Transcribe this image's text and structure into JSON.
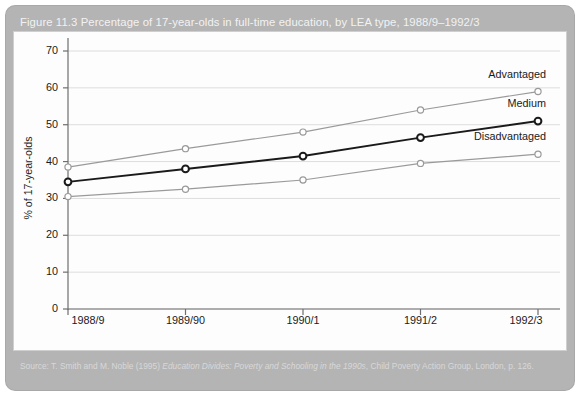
{
  "figure": {
    "caption": "Figure 11.3   Percentage of 17-year-olds in full-time education, by LEA type, 1988/9–1992/3",
    "source_prefix": "Source: T. Smith and M. Noble (1995) ",
    "source_italic": "Education Divides: Poverty and Schooling in the 1990s",
    "source_suffix": ", Child Poverty Action Group, London, p. 126."
  },
  "chart_data": {
    "type": "line",
    "title": "Percentage of 17-year-olds in full-time education, by LEA type, 1988/9–1992/3",
    "xlabel": "",
    "ylabel": "% of 17-year-olds",
    "categories": [
      "1988/9",
      "1989/90",
      "1990/1",
      "1991/2",
      "1992/3"
    ],
    "ylim": [
      0,
      70
    ],
    "yticks": [
      0,
      10,
      20,
      30,
      40,
      50,
      60,
      70
    ],
    "grid": true,
    "legend_position": "right-inline",
    "series": [
      {
        "name": "Advantaged",
        "color": "#9a9a9a",
        "values": [
          38.5,
          43.5,
          48.0,
          54.0,
          59.0
        ]
      },
      {
        "name": "Medium",
        "color": "#1a1a1a",
        "values": [
          34.5,
          38.0,
          41.5,
          46.5,
          51.0
        ]
      },
      {
        "name": "Disadvantaged",
        "color": "#9a9a9a",
        "values": [
          30.5,
          32.5,
          35.0,
          39.5,
          42.0
        ]
      }
    ]
  },
  "colors": {
    "panel": "#b4b4b4",
    "plot_background": "#fdfdfd",
    "axis": "#6e6e6e",
    "grid": "#dddddd",
    "caption_text": "#f2f2f2"
  }
}
